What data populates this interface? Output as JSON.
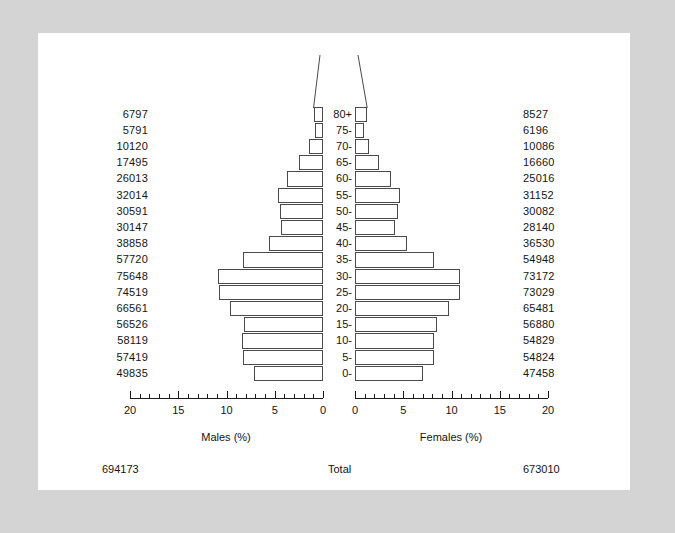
{
  "chart_data": {
    "type": "bar",
    "subtype": "population-pyramid",
    "title": "",
    "categories": [
      "0-",
      "5-",
      "10-",
      "15-",
      "20-",
      "25-",
      "30-",
      "35-",
      "40-",
      "45-",
      "50-",
      "55-",
      "60-",
      "65-",
      "70-",
      "75-",
      "80+"
    ],
    "series": [
      {
        "name": "Males (%)",
        "axis_label": "Males (%)",
        "direction": "left",
        "values": [
          49835,
          57419,
          58119,
          56526,
          66561,
          74519,
          75648,
          57720,
          38858,
          30147,
          30591,
          32014,
          26013,
          17495,
          10120,
          5791,
          6797
        ],
        "total": 694173
      },
      {
        "name": "Females (%)",
        "axis_label": "Females (%)",
        "direction": "right",
        "values": [
          47458,
          54824,
          54829,
          56880,
          65481,
          73029,
          73172,
          54948,
          36530,
          28140,
          30082,
          31152,
          25016,
          16660,
          10086,
          6196,
          8527
        ],
        "total": 673010
      }
    ],
    "xlabel": "",
    "ylabel": "",
    "xlim": [
      0,
      20
    ],
    "x_unit": "percent",
    "tick_labels_left": [
      "20",
      "15",
      "10",
      "5",
      "0"
    ],
    "tick_labels_right": [
      "0",
      "5",
      "10",
      "15",
      "20"
    ],
    "major_tick_values": [
      0,
      5,
      10,
      15,
      20
    ],
    "minor_tick_step": 1,
    "grid": false,
    "legend": "none"
  },
  "labels": {
    "males_axis_title": "Males (%)",
    "females_axis_title": "Females (%)",
    "total_label": "Total",
    "males_total": "694173",
    "females_total": "673010"
  },
  "colors": {
    "page_background": "#d4d4d4",
    "canvas_background": "#ffffff",
    "bar_stroke": "#4a4a4a",
    "axis": "#1a1a1a",
    "text": "#141414"
  }
}
